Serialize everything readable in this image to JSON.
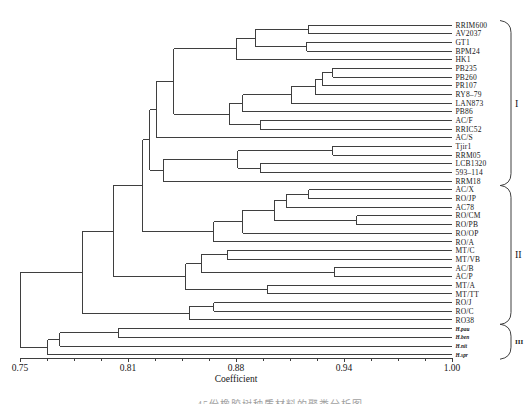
{
  "colors": {
    "line": "#3f3f3f",
    "text": "#161616"
  },
  "caption_partial": "45份橡胶树种质材料的聚类分析图",
  "chart_data": {
    "type": "dendrogram",
    "orientation": "right-labels",
    "xlabel": "Coefficient",
    "axis_range": [
      0.75,
      1.0
    ],
    "axis_tick_labels": [
      "0.75",
      "0.81",
      "0.88",
      "0.94",
      "1.00"
    ],
    "minor_ticks_per_interval": 4,
    "plot": {
      "x0": 20,
      "x1": 452,
      "y0": 25,
      "dy": 8.676,
      "axis_y": 358,
      "label_x": 455.5
    },
    "leaf_order": [
      "RRIM600",
      "AV2037",
      "GT1",
      "BPM24",
      "HK1",
      "PB235",
      "PB260",
      "PR107",
      "RY8–79",
      "LAN873",
      "PB86",
      "AC/F",
      "RRIC52",
      "AC/S",
      "Tjir1",
      "RRM05",
      "LCB1320",
      "593–114",
      "RRM18",
      "AC/X",
      "RO/JP",
      "AC78",
      "RO/CM",
      "RO/PB",
      "RO/OP",
      "RO/A",
      "MT/C",
      "MT/VB",
      "AC/B",
      "AC/P",
      "MT/A",
      "MT/TT",
      "RO/J",
      "RO/C",
      "RO38",
      "H.pau",
      "H.ben",
      "H.nit",
      "H.spr"
    ],
    "groups": [
      {
        "label": "I",
        "from_leaf": 0,
        "to_leaf": 18
      },
      {
        "label": "II",
        "from_leaf": 19,
        "to_leaf": 34
      },
      {
        "label": "III",
        "from_leaf": 35,
        "to_leaf": 38
      }
    ],
    "tree": {
      "c": 0.75,
      "children": [
        {
          "c": 0.786,
          "children": [
            {
              "c": 0.804,
              "children": [
                {
                  "c": 0.821,
                  "children": [
                    {
                      "c": 0.825,
                      "children": [
                        {
                          "c": 0.829,
                          "children": [
                            {
                              "c": 0.839,
                              "children": [
                                {
                                  "c": 0.875,
                                  "children": [
                                    {
                                      "c": 0.886,
                                      "children": [
                                        {
                                          "c": 0.917,
                                          "children": [
                                            {
                                              "name": "RRIM600"
                                            },
                                            {
                                              "name": "AV2037"
                                            }
                                          ]
                                        },
                                        {
                                          "c": 0.916,
                                          "children": [
                                            {
                                              "name": "GT1"
                                            },
                                            {
                                              "name": "BPM24"
                                            }
                                          ]
                                        }
                                      ]
                                    },
                                    {
                                      "name": "HK1"
                                    }
                                  ]
                                },
                                {
                                  "c": 0.871,
                                  "children": [
                                    {
                                      "c": 0.879,
                                      "children": [
                                        {
                                          "c": 0.907,
                                          "children": [
                                            {
                                              "c": 0.921,
                                              "children": [
                                                {
                                                  "c": 0.925,
                                                  "children": [
                                                    {
                                                      "c": 0.931,
                                                      "children": [
                                                        {
                                                          "name": "PB235"
                                                        },
                                                        {
                                                          "name": "PB260"
                                                        }
                                                      ]
                                                    },
                                                    {
                                                      "name": "PR107"
                                                    }
                                                  ]
                                                },
                                                {
                                                  "name": "RY8–79"
                                                }
                                              ]
                                            },
                                            {
                                              "name": "LAN873"
                                            }
                                          ]
                                        },
                                        {
                                          "name": "PB86"
                                        }
                                      ]
                                    },
                                    {
                                      "c": 0.889,
                                      "children": [
                                        {
                                          "name": "AC/F"
                                        },
                                        {
                                          "name": "RRIC52"
                                        }
                                      ]
                                    }
                                  ]
                                }
                              ]
                            },
                            {
                              "name": "AC/S"
                            }
                          ]
                        },
                        {
                          "c": 0.833,
                          "children": [
                            {
                              "c": 0.876,
                              "children": [
                                {
                                  "c": 0.931,
                                  "children": [
                                    {
                                      "name": "Tjir1"
                                    },
                                    {
                                      "name": "RRM05"
                                    }
                                  ]
                                },
                                {
                                  "c": 0.889,
                                  "children": [
                                    {
                                      "name": "LCB1320"
                                    },
                                    {
                                      "name": "593–114"
                                    }
                                  ]
                                }
                              ]
                            },
                            {
                              "name": "RRM18"
                            }
                          ]
                        }
                      ]
                    },
                    {
                      "c": 0.862,
                      "children": [
                        {
                          "c": 0.879,
                          "children": [
                            {
                              "c": 0.897,
                              "children": [
                                {
                                  "c": 0.904,
                                  "children": [
                                    {
                                      "c": 0.917,
                                      "children": [
                                        {
                                          "name": "AC/X"
                                        },
                                        {
                                          "name": "RO/JP"
                                        }
                                      ]
                                    },
                                    {
                                      "name": "AC78"
                                    }
                                  ]
                                },
                                {
                                  "c": 0.945,
                                  "children": [
                                    {
                                      "name": "RO/CM"
                                    },
                                    {
                                      "name": "RO/PB"
                                    }
                                  ]
                                }
                              ]
                            },
                            {
                              "name": "RO/OP"
                            }
                          ]
                        },
                        {
                          "name": "RO/A"
                        }
                      ]
                    }
                  ]
                },
                {
                  "c": 0.846,
                  "children": [
                    {
                      "c": 0.855,
                      "children": [
                        {
                          "c": 0.87,
                          "children": [
                            {
                              "name": "MT/C"
                            },
                            {
                              "name": "MT/VB"
                            }
                          ]
                        },
                        {
                          "c": 0.932,
                          "children": [
                            {
                              "name": "AC/B"
                            },
                            {
                              "name": "AC/P"
                            }
                          ]
                        }
                      ]
                    },
                    {
                      "c": 0.893,
                      "children": [
                        {
                          "name": "MT/A"
                        },
                        {
                          "name": "MT/TT"
                        }
                      ]
                    }
                  ]
                }
              ]
            },
            {
              "c": 0.848,
              "children": [
                {
                  "c": 0.862,
                  "children": [
                    {
                      "name": "RO/J"
                    },
                    {
                      "name": "RO/C"
                    }
                  ]
                },
                {
                  "name": "RO38"
                }
              ]
            }
          ]
        },
        {
          "c": 0.766,
          "children": [
            {
              "c": 0.773,
              "children": [
                {
                  "c": 0.807,
                  "children": [
                    {
                      "name": "H.pau",
                      "bold": true
                    },
                    {
                      "name": "H.ben",
                      "bold": true
                    }
                  ]
                },
                {
                  "name": "H.nit",
                  "bold": true
                }
              ]
            },
            {
              "name": "H.spr",
              "bold": true
            }
          ]
        }
      ]
    }
  }
}
